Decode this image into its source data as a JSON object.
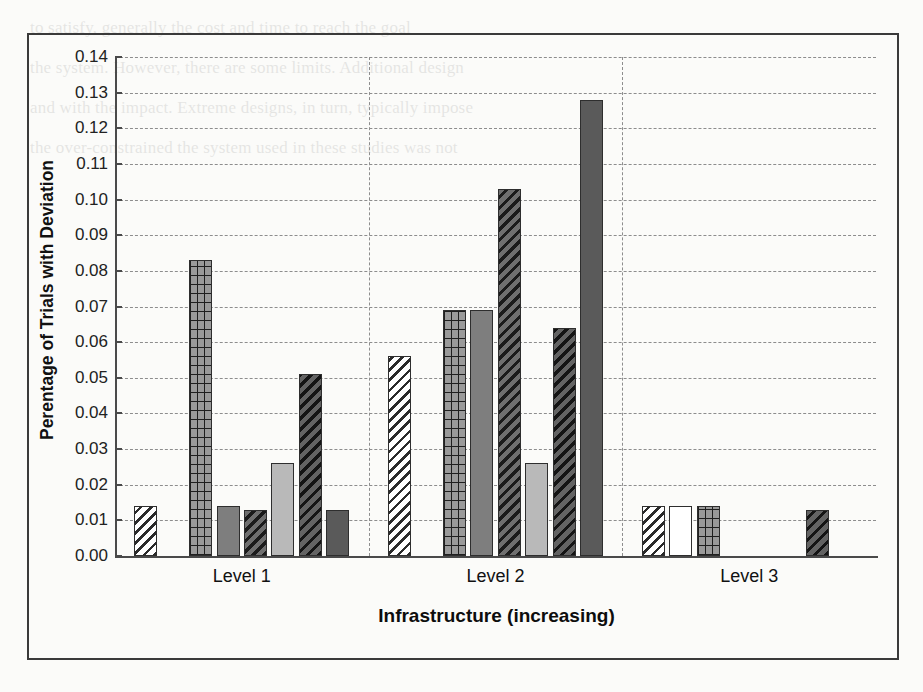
{
  "chart_data": {
    "type": "bar",
    "title": "",
    "xlabel": "Infrastructure (increasing)",
    "ylabel": "Perentage of Trials with Deviation",
    "categories": [
      "Level 1",
      "Level 2",
      "Level 3"
    ],
    "ylim": [
      0.0,
      0.14
    ],
    "ytick_labels": [
      "0.14",
      "0.13",
      "0.12",
      "0.11",
      "0.10",
      "0.09",
      "0.08",
      "0.07",
      "0.06",
      "0.05",
      "0.04",
      "0.03",
      "0.02",
      "0.01",
      "0.00"
    ],
    "ytick_values": [
      0.14,
      0.13,
      0.12,
      0.11,
      0.1,
      0.09,
      0.08,
      0.07,
      0.06,
      0.05,
      0.04,
      0.03,
      0.02,
      0.01,
      0.0
    ],
    "grid": true,
    "legend": "none",
    "series": [
      {
        "name": "Series 1",
        "pattern": "diagonal-hatch-light",
        "values": [
          0.014,
          0.056,
          0.014
        ]
      },
      {
        "name": "Series 2",
        "pattern": "white-empty",
        "values": [
          0.0,
          0.0,
          0.014
        ]
      },
      {
        "name": "Series 3",
        "pattern": "grid-checker",
        "values": [
          0.083,
          0.069,
          0.014
        ]
      },
      {
        "name": "Series 4",
        "pattern": "solid-gray",
        "values": [
          0.014,
          0.069,
          0.0
        ]
      },
      {
        "name": "Series 5",
        "pattern": "diagonal-hatch-dark",
        "values": [
          0.013,
          0.103,
          0.0
        ]
      },
      {
        "name": "Series 6",
        "pattern": "solid-light-gray",
        "values": [
          0.026,
          0.026,
          0.0
        ]
      },
      {
        "name": "Series 7",
        "pattern": "diagonal-hatch-dark2",
        "values": [
          0.051,
          0.064,
          0.013
        ]
      },
      {
        "name": "Series 8",
        "pattern": "solid-dark",
        "values": [
          0.013,
          0.128,
          0.0
        ]
      }
    ]
  },
  "bars": [
    {
      "group": 0,
      "index": 0,
      "value": 0.014,
      "pattern": "diagonal-hatch-light"
    },
    {
      "group": 0,
      "index": 2,
      "value": 0.083,
      "pattern": "grid-checker"
    },
    {
      "group": 0,
      "index": 3,
      "value": 0.014,
      "pattern": "solid-gray"
    },
    {
      "group": 0,
      "index": 4,
      "value": 0.013,
      "pattern": "diagonal-hatch-dark"
    },
    {
      "group": 0,
      "index": 5,
      "value": 0.026,
      "pattern": "solid-light-gray"
    },
    {
      "group": 0,
      "index": 6,
      "value": 0.051,
      "pattern": "diagonal-hatch-dark2"
    },
    {
      "group": 0,
      "index": 7,
      "value": 0.013,
      "pattern": "solid-dark"
    },
    {
      "group": 1,
      "index": 0,
      "value": 0.056,
      "pattern": "diagonal-hatch-light"
    },
    {
      "group": 1,
      "index": 2,
      "value": 0.069,
      "pattern": "grid-checker"
    },
    {
      "group": 1,
      "index": 3,
      "value": 0.069,
      "pattern": "solid-gray"
    },
    {
      "group": 1,
      "index": 4,
      "value": 0.103,
      "pattern": "diagonal-hatch-dark"
    },
    {
      "group": 1,
      "index": 5,
      "value": 0.026,
      "pattern": "solid-light-gray"
    },
    {
      "group": 1,
      "index": 6,
      "value": 0.064,
      "pattern": "diagonal-hatch-dark2"
    },
    {
      "group": 1,
      "index": 7,
      "value": 0.128,
      "pattern": "solid-dark"
    },
    {
      "group": 2,
      "index": 0,
      "value": 0.014,
      "pattern": "diagonal-hatch-light"
    },
    {
      "group": 2,
      "index": 1,
      "value": 0.014,
      "pattern": "white-empty"
    },
    {
      "group": 2,
      "index": 2,
      "value": 0.014,
      "pattern": "grid-checker"
    },
    {
      "group": 2,
      "index": 6,
      "value": 0.013,
      "pattern": "diagonal-hatch-dark2"
    }
  ],
  "background_text": {
    "lines": [
      "",
      "",
      "",
      "",
      "",
      "",
      "",
      "",
      "",
      "",
      "",
      "",
      "",
      "",
      "",
      "",
      "to satisfy, generally the cost and time to reach the goal",
      "the system. However, there are some limits. Additional design",
      "and with the impact. Extreme designs, in turn, typically impose",
      "the over-constrained the system used in these studies was not"
    ]
  }
}
